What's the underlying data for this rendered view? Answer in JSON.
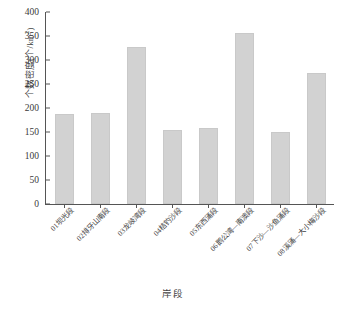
{
  "chart_data": {
    "type": "bar",
    "title": "",
    "xlabel": "岸段",
    "ylabel": "个数密度(个/km²)",
    "ylabel_main": "个数密度(个/km",
    "ylabel_sup": "2",
    "ylabel_tail": ")",
    "ylim": [
      0,
      400
    ],
    "ytick_step": 50,
    "yticks": [
      0,
      50,
      100,
      150,
      200,
      250,
      300,
      350,
      400
    ],
    "ytick_labels": [
      "0",
      "50",
      "100",
      "150",
      "200",
      "250",
      "300",
      "350",
      "400"
    ],
    "grid": false,
    "legend": false,
    "bar_color": "#d2d2d2",
    "axis_color": "#555555",
    "categories": [
      "01坝光段",
      "02排牙山南段",
      "03龙岐湾段",
      "04桔钓沙段",
      "05东西涌段",
      "06鹅公湾—南澳段",
      "07下沙—沙鱼涌段",
      "08溪涌—大小梅沙段"
    ],
    "values": [
      188,
      189,
      327,
      154,
      159,
      357,
      151,
      272
    ]
  }
}
